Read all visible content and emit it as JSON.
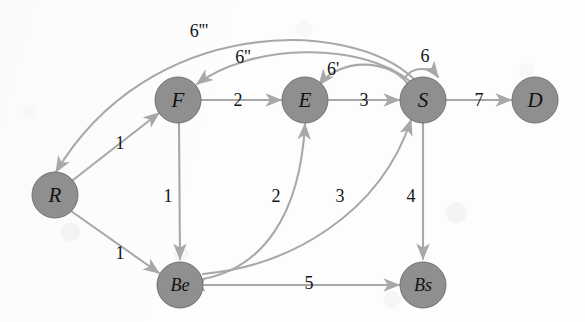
{
  "diagram": {
    "background_color": "#fdfdfd",
    "node_fill": "#8f8f8f",
    "node_stroke": "#6f6f6f",
    "edge_color": "#a8a8a8",
    "label_color": "#151515"
  },
  "nodes": [
    {
      "id": "R",
      "label": "R",
      "x": 55,
      "y": 195,
      "r": 23
    },
    {
      "id": "F",
      "label": "F",
      "x": 178,
      "y": 100,
      "r": 23
    },
    {
      "id": "E",
      "label": "E",
      "x": 305,
      "y": 100,
      "r": 23
    },
    {
      "id": "S",
      "label": "S",
      "x": 423,
      "y": 100,
      "r": 23
    },
    {
      "id": "D",
      "label": "D",
      "x": 535,
      "y": 100,
      "r": 23
    },
    {
      "id": "Be",
      "label": "Be",
      "x": 180,
      "y": 285,
      "r": 23
    },
    {
      "id": "Bs",
      "label": "Bs",
      "x": 423,
      "y": 285,
      "r": 23
    }
  ],
  "edges": [
    {
      "id": "R-F",
      "from": "R",
      "to": "F",
      "weight": "1",
      "label_x": 120,
      "label_y": 143,
      "shape": "straight"
    },
    {
      "id": "R-Be",
      "from": "R",
      "to": "Be",
      "weight": "1",
      "label_x": 120,
      "label_y": 253,
      "shape": "straight"
    },
    {
      "id": "F-E",
      "from": "F",
      "to": "E",
      "weight": "2",
      "label_x": 238,
      "label_y": 100,
      "shape": "straight"
    },
    {
      "id": "F-Be",
      "from": "F",
      "to": "Be",
      "weight": "1",
      "label_x": 168,
      "label_y": 196,
      "shape": "straight"
    },
    {
      "id": "E-S",
      "from": "E",
      "to": "S",
      "weight": "3",
      "label_x": 364,
      "label_y": 100,
      "shape": "straight"
    },
    {
      "id": "S-D",
      "from": "S",
      "to": "D",
      "weight": "7",
      "label_x": 479,
      "label_y": 100,
      "shape": "straight"
    },
    {
      "id": "S-Bs",
      "from": "S",
      "to": "Bs",
      "weight": "4",
      "label_x": 411,
      "label_y": 196,
      "shape": "straight"
    },
    {
      "id": "Be-Bs",
      "from": "Be",
      "to": "Bs",
      "weight": "5",
      "label_x": 309,
      "label_y": 283,
      "shape": "bidirectional"
    },
    {
      "id": "Be-E",
      "from": "Be",
      "to": "E",
      "weight": "2",
      "label_x": 276,
      "label_y": 196,
      "shape": "curve"
    },
    {
      "id": "Be-S",
      "from": "Be",
      "to": "S",
      "weight": "3",
      "label_x": 340,
      "label_y": 196,
      "shape": "curve"
    },
    {
      "id": "S-E",
      "from": "S",
      "to": "E",
      "weight": "6'",
      "label_x": 333,
      "label_y": 69,
      "shape": "curve"
    },
    {
      "id": "S-F",
      "from": "S",
      "to": "F",
      "weight": "6''",
      "label_x": 243,
      "label_y": 57,
      "shape": "curve"
    },
    {
      "id": "S-R",
      "from": "S",
      "to": "R",
      "weight": "6'''",
      "label_x": 199,
      "label_y": 31,
      "shape": "curve"
    },
    {
      "id": "S-loop",
      "from": "S",
      "to": "S",
      "weight": "6",
      "label_x": 425,
      "label_y": 56,
      "shape": "loop"
    }
  ]
}
